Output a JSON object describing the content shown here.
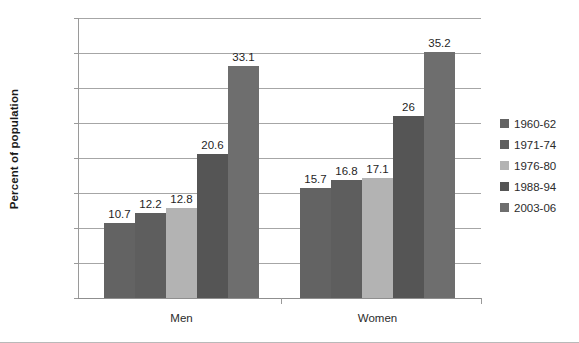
{
  "chart_data": {
    "type": "bar",
    "title": "",
    "xlabel": "",
    "ylabel": "Percent of population",
    "ylim": [
      0,
      40
    ],
    "ytick_step": 5,
    "yticks": [
      "0",
      "5",
      "10",
      "15",
      "20",
      "25",
      "30",
      "35",
      "40"
    ],
    "grid": true,
    "legend_position": "right",
    "categories": [
      "Men",
      "Women"
    ],
    "series": [
      {
        "name": "1960-62",
        "color": "#636363",
        "values": [
          10.7,
          15.7
        ],
        "labels": [
          "10.7",
          "15.7"
        ]
      },
      {
        "name": "1971-74",
        "color": "#5e5e5e",
        "values": [
          12.2,
          16.8
        ],
        "labels": [
          "12.2",
          "16.8"
        ]
      },
      {
        "name": "1976-80",
        "color": "#b3b3b3",
        "values": [
          12.8,
          17.1
        ],
        "labels": [
          "12.8",
          "17.1"
        ]
      },
      {
        "name": "1988-94",
        "color": "#555555",
        "values": [
          20.6,
          26.0
        ],
        "labels": [
          "20.6",
          "26"
        ]
      },
      {
        "name": "2003-06",
        "color": "#6e6e6e",
        "values": [
          33.1,
          35.2
        ],
        "labels": [
          "33.1",
          "35.2"
        ]
      }
    ]
  },
  "colors": {
    "gridline": "#a6a6a6",
    "axis": "#9a9a9a",
    "text": "#2b2b2b",
    "background": "#ffffff"
  }
}
